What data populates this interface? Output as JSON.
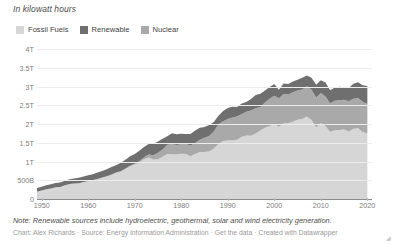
{
  "subtitle": "In kilowatt hours",
  "legend": {
    "items": [
      {
        "label": "Fossil Fuels",
        "color": "#d6d6d6"
      },
      {
        "label": "Renewable",
        "color": "#6f6f6f"
      },
      {
        "label": "Nuclear",
        "color": "#a9a9a9"
      }
    ]
  },
  "footer": {
    "note": "Note: Renewable sources include hydroelectric, geothermal, solar and wind electricity generation.",
    "chart_by_label": "Chart: Alex Richards",
    "source_label": "Source: Energy Information Administration",
    "get_data_label": "Get the data",
    "created_with_label": "Created with Datawrapper",
    "separator": "·"
  },
  "chart_data": {
    "type": "area",
    "title": "",
    "subtitle": "In kilowatt hours",
    "xlabel": "",
    "ylabel": "",
    "stacked": true,
    "grid": true,
    "legend_position": "top-left",
    "xlim": [
      1949,
      2021
    ],
    "ylim": [
      0,
      4250000000000
    ],
    "ytick_labels": [
      "0",
      "500B",
      "1T",
      "1.5T",
      "2T",
      "2.5T",
      "3T",
      "3.5T",
      "4T"
    ],
    "ytick_values": [
      0,
      500000000000,
      1000000000000,
      1500000000000,
      2000000000000,
      2500000000000,
      3000000000000,
      3500000000000,
      4000000000000
    ],
    "xtick_labels": [
      "1950",
      "1960",
      "1970",
      "1980",
      "1990",
      "2000",
      "2010",
      "2020"
    ],
    "xtick_values": [
      1950,
      1960,
      1970,
      1980,
      1990,
      2000,
      2010,
      2020
    ],
    "x": [
      1949,
      1950,
      1951,
      1952,
      1953,
      1954,
      1955,
      1956,
      1957,
      1958,
      1959,
      1960,
      1961,
      1962,
      1963,
      1964,
      1965,
      1966,
      1967,
      1968,
      1969,
      1970,
      1971,
      1972,
      1973,
      1974,
      1975,
      1976,
      1977,
      1978,
      1979,
      1980,
      1981,
      1982,
      1983,
      1984,
      1985,
      1986,
      1987,
      1988,
      1989,
      1990,
      1991,
      1992,
      1993,
      1994,
      1995,
      1996,
      1997,
      1998,
      1999,
      2000,
      2001,
      2002,
      2003,
      2004,
      2005,
      2006,
      2007,
      2008,
      2009,
      2010,
      2011,
      2012,
      2013,
      2014,
      2015,
      2016,
      2017,
      2018,
      2019,
      2020
    ],
    "series": [
      {
        "name": "Fossil Fuels",
        "color": "#d6d6d6",
        "unit": "kWh",
        "values": [
          194,
          227,
          260,
          281,
          312,
          324,
          369,
          401,
          414,
          418,
          457,
          483,
          503,
          535,
          573,
          608,
          649,
          700,
          736,
          804,
          875,
          925,
          975,
          1063,
          1107,
          1053,
          1063,
          1131,
          1202,
          1197,
          1190,
          1212,
          1200,
          1144,
          1201,
          1253,
          1256,
          1272,
          1352,
          1470,
          1547,
          1561,
          1568,
          1585,
          1664,
          1694,
          1691,
          1750,
          1831,
          1906,
          1949,
          2007,
          1922,
          2027,
          2026,
          2064,
          2121,
          2140,
          2207,
          2112,
          1915,
          2024,
          1948,
          1789,
          1840,
          1844,
          1858,
          1806,
          1877,
          1892,
          1792,
          1752
        ]
      },
      {
        "name": "Nuclear",
        "color": "#a9a9a9",
        "unit": "kWh",
        "values": [
          0,
          0,
          0,
          0,
          0,
          0,
          0,
          0,
          0,
          0,
          0,
          1,
          2,
          2,
          3,
          3,
          4,
          6,
          8,
          13,
          14,
          22,
          38,
          54,
          83,
          114,
          173,
          191,
          251,
          276,
          255,
          251,
          273,
          283,
          294,
          328,
          384,
          414,
          455,
          527,
          529,
          577,
          613,
          619,
          610,
          640,
          673,
          675,
          629,
          674,
          728,
          754,
          769,
          780,
          764,
          789,
          782,
          787,
          806,
          806,
          799,
          807,
          790,
          769,
          789,
          797,
          797,
          806,
          805,
          807,
          809,
          790
        ]
      },
      {
        "name": "Renewable",
        "color": "#6f6f6f",
        "unit": "kWh",
        "values": [
          97,
          103,
          110,
          116,
          117,
          115,
          118,
          127,
          134,
          150,
          144,
          152,
          158,
          172,
          173,
          183,
          200,
          196,
          226,
          230,
          256,
          254,
          274,
          276,
          277,
          306,
          304,
          288,
          224,
          285,
          285,
          284,
          262,
          310,
          334,
          323,
          285,
          292,
          253,
          226,
          274,
          293,
          283,
          254,
          281,
          260,
          311,
          357,
          356,
          323,
          320,
          313,
          231,
          281,
          281,
          285,
          282,
          313,
          288,
          323,
          337,
          345,
          376,
          346,
          349,
          357,
          335,
          357,
          400,
          422,
          440,
          477
        ]
      }
    ],
    "series_order_bottom_to_top": [
      "Fossil Fuels",
      "Nuclear",
      "Renewable"
    ],
    "value_scale_note": "values in billions of kWh",
    "peak_total_year": 2007,
    "peak_total_value": 3301
  }
}
